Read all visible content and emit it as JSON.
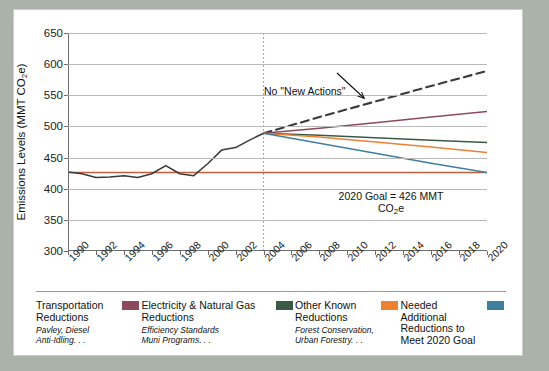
{
  "chart_data": {
    "type": "line",
    "title": "",
    "xlabel": "",
    "ylabel": "Emissions Levels (MMT CO2e)",
    "ylabel_prefix": "Emissions Levels (MMT CO",
    "ylabel_sub": "2",
    "ylabel_suffix": "e)",
    "xlim": [
      1990,
      2020
    ],
    "ylim": [
      300,
      650
    ],
    "yticks": [
      300,
      350,
      400,
      450,
      500,
      550,
      600,
      650
    ],
    "xticks": [
      1990,
      1992,
      1994,
      1996,
      1998,
      2000,
      2002,
      2004,
      2006,
      2008,
      2010,
      2012,
      2014,
      2016,
      2018,
      2020
    ],
    "grid": true,
    "legend_position": "below",
    "annotations": [
      {
        "name": "bau-label",
        "text": "No \"New Actions\"",
        "x": 2001,
        "y": 565
      },
      {
        "name": "goal-label-line1",
        "text": "2020 Goal = 426 MMT",
        "x": 2012,
        "y": 420
      },
      {
        "name": "goal-label-line2",
        "text": "CO2e",
        "x": 2012,
        "y": 405
      }
    ],
    "goal_line": {
      "name": "2020 Goal",
      "value": 426,
      "color": "#c0603c"
    },
    "divider_year": 2004,
    "series": [
      {
        "name": "Historical Emissions",
        "color": "#3a3a3a",
        "style": "solid",
        "x": [
          1990,
          1991,
          1992,
          1993,
          1994,
          1995,
          1996,
          1997,
          1998,
          1999,
          2000,
          2001,
          2002,
          2003,
          2004
        ],
        "values": [
          427,
          424,
          418,
          419,
          421,
          418,
          424,
          437,
          424,
          421,
          440,
          462,
          466,
          478,
          489
        ]
      },
      {
        "name": "No \"New Actions\"",
        "color": "#3a3a3a",
        "style": "dashed",
        "x": [
          2004,
          2008,
          2012,
          2016,
          2020
        ],
        "values": [
          489,
          515,
          540,
          565,
          589
        ]
      },
      {
        "name": "Transportation Reductions",
        "color": "#8d4a5c",
        "style": "solid",
        "x": [
          2004,
          2008,
          2012,
          2016,
          2020
        ],
        "values": [
          489,
          497,
          506,
          515,
          524
        ]
      },
      {
        "name": "Electricity & Natural Gas Reductions",
        "color": "#3a5a46",
        "style": "solid",
        "x": [
          2004,
          2008,
          2012,
          2016,
          2020
        ],
        "values": [
          489,
          486,
          482,
          478,
          474
        ]
      },
      {
        "name": "Other Known Reductions",
        "color": "#ee8033",
        "style": "solid",
        "x": [
          2004,
          2008,
          2012,
          2016,
          2020
        ],
        "values": [
          489,
          483,
          475,
          467,
          458
        ]
      },
      {
        "name": "Needed Additional Reductions to Meet 2020 Goal",
        "color": "#3f7f9e",
        "style": "solid",
        "x": [
          2004,
          2008,
          2012,
          2016,
          2020
        ],
        "values": [
          489,
          473,
          457,
          441,
          426
        ]
      }
    ]
  },
  "legend": {
    "items": [
      {
        "title_line1": "Transportation",
        "title_line2": "Reductions",
        "sub_line1": "Pavley, Diesel",
        "sub_line2": "Anti-Idling. . .",
        "color": "#8d4a5c"
      },
      {
        "title_line1": "Electricity & Natural Gas",
        "title_line2": "Reductions",
        "sub_line1": "Efficiency Standards",
        "sub_line2": "Muni Programs. . .",
        "color": "#3a5a46"
      },
      {
        "title_line1": "Other Known",
        "title_line2": "Reductions",
        "sub_line1": "Forest Conservation,",
        "sub_line2": "Urban Forestry. . .",
        "color": "#ee8033"
      },
      {
        "title_line1": "Needed Additional",
        "title_line2": "Reductions to",
        "sub_line1": "Meet 2020 Goal",
        "sub_line2": "",
        "color": "#3f7f9e"
      }
    ]
  }
}
